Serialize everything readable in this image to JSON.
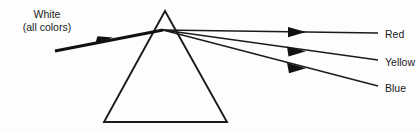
{
  "diagram": {
    "background_color": "#fdfdfd",
    "stroke_color": "#1a1a1a",
    "source": {
      "line1": "White",
      "line2": "(all colors)"
    },
    "prism": {
      "name": "triangular-prism",
      "apex": [
        165,
        11
      ],
      "base_left": [
        104,
        122
      ],
      "base_right": [
        227,
        122
      ]
    },
    "incident_ray": {
      "label": "white-light-ray",
      "start": [
        55,
        51
      ],
      "end": [
        163,
        30
      ],
      "arrow_tip": [
        111,
        38
      ]
    },
    "refraction_point": [
      163,
      30
    ],
    "output_rays": [
      {
        "name": "red-ray",
        "label": "Red",
        "color_name": "red",
        "arrow_tip": [
          305,
          32
        ],
        "line_end": [
          378,
          33
        ]
      },
      {
        "name": "yellow-ray",
        "label": "Yellow",
        "color_name": "yellow",
        "arrow_tip": [
          305,
          51
        ],
        "line_end": [
          378,
          60
        ]
      },
      {
        "name": "blue-ray",
        "label": "Blue",
        "color_name": "blue",
        "arrow_tip": [
          305,
          68
        ],
        "line_end": [
          378,
          86
        ]
      }
    ]
  }
}
